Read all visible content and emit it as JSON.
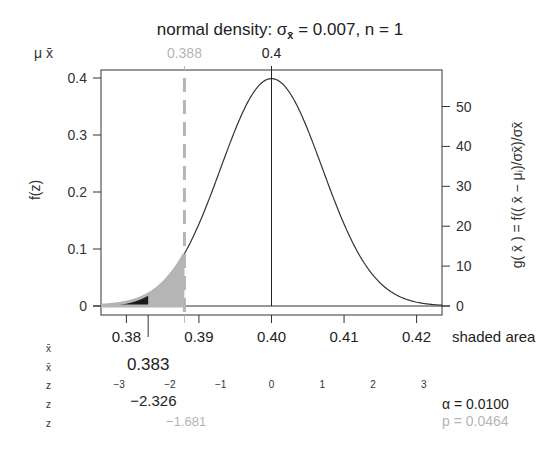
{
  "chart_data": {
    "type": "area",
    "title": "normal density:  σx̄ = 0.007,  n = 1",
    "title_parts": {
      "prefix": "normal density:  σ",
      "sub": "x̄",
      "suffix": " = 0.007,  n = 1"
    },
    "mu": 0.4,
    "sigma": 0.007,
    "n": 1,
    "xlim": [
      0.3765,
      0.4235
    ],
    "ylim_left": [
      0,
      0.4
    ],
    "left_axis": {
      "label": "f(z)",
      "ticks": [
        0,
        0.1,
        0.2,
        0.3,
        0.4
      ],
      "tick_labels": [
        "0",
        "0.1",
        "0.2",
        "0.3",
        "0.4"
      ]
    },
    "right_axis": {
      "label": "g( x̄ ) = f(( x̄ − μᵢ)/σx̄)/σx̄",
      "ticks": [
        0,
        10,
        20,
        30,
        40,
        50
      ],
      "tick_labels": [
        "0",
        "10",
        "20",
        "30",
        "40",
        "50"
      ]
    },
    "x_axis": {
      "ticks": [
        0.38,
        0.39,
        0.4,
        0.41,
        0.42
      ],
      "tick_labels": [
        "0.38",
        "0.39",
        "0.40",
        "0.41",
        "0.42"
      ],
      "right_label": "shaded area"
    },
    "top_axis": {
      "row_label": "μ  x̄",
      "mu_value": 0.4,
      "mu_label": "0.4",
      "xbar_value": 0.388,
      "xbar_label": "0.388"
    },
    "critical": {
      "xbar": 0.383,
      "xbar_label": "0.383",
      "z": -2.326,
      "z_label": "−2.326"
    },
    "observed": {
      "xbar": 0.388,
      "z": -1.681,
      "z_label": "−1.681"
    },
    "z_ticks": [
      -3,
      -2,
      -1,
      0,
      1,
      2,
      3
    ],
    "z_tick_labels": [
      "−3",
      "−2",
      "−1",
      "0",
      "1",
      "2",
      "3"
    ],
    "row_labels": [
      "x̄",
      "x̄",
      "z",
      "z",
      "z"
    ],
    "alpha_label": "α = 0.0100",
    "p_label": "p = 0.0464",
    "colors": {
      "curve": "#333333",
      "alpha_fill": "#1a1a1a",
      "p_fill": "#b5b5b5",
      "observed": "#b5b5b5",
      "frame": "#555555"
    }
  }
}
